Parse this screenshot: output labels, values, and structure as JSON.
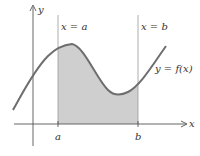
{
  "diagram": {
    "type": "definite-integral-area",
    "axes": {
      "x_label": "x",
      "y_label": "y"
    },
    "bounds": {
      "left_line_label": "x = a",
      "right_line_label": "x = b",
      "left_tick_label": "a",
      "right_tick_label": "b"
    },
    "curve_label": "y = f(x)",
    "colors": {
      "curve": "#6e6e6e",
      "shaded_region": "#cfcfcf",
      "axis": "#555555",
      "bound_lines": "#aaaaaa",
      "text": "#333333"
    }
  }
}
